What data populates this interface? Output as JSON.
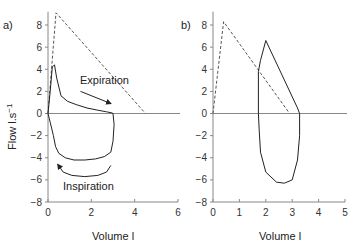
{
  "chart_data": [
    {
      "type": "line",
      "panel_label": "a)",
      "xlabel": "Volume l",
      "ylabel": "Flow l.s⁻¹",
      "xlim": [
        0,
        6
      ],
      "ylim": [
        -8,
        9
      ],
      "xticks": [
        0,
        2,
        4,
        6
      ],
      "yticks": [
        8,
        6,
        4,
        2,
        0,
        -2,
        -4,
        -6,
        -8
      ],
      "grid": false,
      "annotations": [
        {
          "text": "Expiration",
          "x": 1.7,
          "y": 2.6
        },
        {
          "text": "Inspiration",
          "x": 0.65,
          "y": -7.0
        }
      ],
      "series": [
        {
          "name": "predicted",
          "style": "dashed",
          "x": [
            0,
            0.37,
            4.5
          ],
          "y": [
            0,
            9.1,
            0
          ]
        },
        {
          "name": "loop",
          "style": "solid",
          "x": [
            0.0,
            0.1,
            0.2,
            0.3,
            0.4,
            0.6,
            0.9,
            1.3,
            1.8,
            2.3,
            2.7,
            2.95,
            3.0,
            3.05,
            3.0,
            2.9,
            2.6,
            2.2,
            1.7,
            1.2,
            0.8,
            0.5,
            0.35,
            0.25,
            0.1,
            0.0
          ],
          "y": [
            0.0,
            2.0,
            4.2,
            4.4,
            3.2,
            1.6,
            1.1,
            0.8,
            0.5,
            0.3,
            0.15,
            0.05,
            0.0,
            -1.0,
            -2.5,
            -3.5,
            -3.9,
            -4.1,
            -4.2,
            -4.2,
            -4.0,
            -3.6,
            -3.0,
            -2.0,
            -0.8,
            0.0
          ]
        },
        {
          "name": "inspiration-arrow",
          "style": "solid-arrow",
          "x": [
            2.9,
            2.7,
            2.3,
            1.7,
            1.1,
            0.7,
            0.45
          ],
          "y": [
            -4.7,
            -5.3,
            -5.6,
            -5.7,
            -5.6,
            -5.3,
            -4.6
          ]
        },
        {
          "name": "expiration-arrow",
          "style": "solid-arrow",
          "x": [
            1.5,
            2.9
          ],
          "y": [
            2.0,
            0.9
          ]
        }
      ]
    },
    {
      "type": "line",
      "panel_label": "b)",
      "xlabel": "Volume l",
      "ylabel": "",
      "xlim": [
        0,
        5
      ],
      "ylim": [
        -8,
        9
      ],
      "xticks": [
        0,
        1,
        2,
        3,
        4,
        5
      ],
      "yticks": [
        8,
        6,
        4,
        2,
        0,
        -2,
        -4,
        -6,
        -8
      ],
      "grid": false,
      "series": [
        {
          "name": "predicted",
          "style": "dashed",
          "x": [
            0,
            0.4,
            2.9
          ],
          "y": [
            0,
            8.3,
            0
          ]
        },
        {
          "name": "loop",
          "style": "solid",
          "x": [
            1.72,
            1.72,
            1.8,
            2.0,
            3.2,
            3.28,
            3.28,
            3.2,
            3.0,
            2.7,
            2.4,
            2.0,
            1.8,
            1.75,
            1.72
          ],
          "y": [
            0.0,
            3.8,
            4.8,
            6.6,
            0.5,
            0.0,
            -2.0,
            -4.2,
            -6.0,
            -6.3,
            -6.2,
            -5.3,
            -3.5,
            -1.5,
            0.0
          ]
        }
      ]
    }
  ],
  "labels": {
    "panel_a": "a)",
    "panel_b": "b)",
    "ylabel": "Flow l.s",
    "ylabel_sup": "−1",
    "xlabel": "Volume l",
    "expiration": "Expiration",
    "inspiration": "Inspiration"
  }
}
